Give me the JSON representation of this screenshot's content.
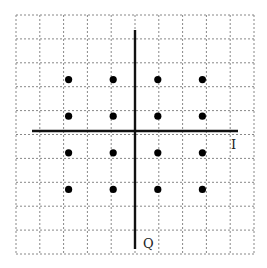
{
  "diagram": {
    "type": "constellation",
    "axes": {
      "horizontal_label": "I",
      "vertical_label": "Q"
    },
    "grid": {
      "divisions": 10,
      "style": "dotted"
    },
    "points": [
      {
        "i": -3,
        "q": 3
      },
      {
        "i": -1,
        "q": 3
      },
      {
        "i": 1,
        "q": 3
      },
      {
        "i": 3,
        "q": 3
      },
      {
        "i": -3,
        "q": 1
      },
      {
        "i": -1,
        "q": 1
      },
      {
        "i": 1,
        "q": 1
      },
      {
        "i": 3,
        "q": 1
      },
      {
        "i": -3,
        "q": -1
      },
      {
        "i": -1,
        "q": -1
      },
      {
        "i": 1,
        "q": -1
      },
      {
        "i": 3,
        "q": -1
      },
      {
        "i": -3,
        "q": -3
      },
      {
        "i": -1,
        "q": -3
      },
      {
        "i": 1,
        "q": -3
      },
      {
        "i": 3,
        "q": -3
      }
    ],
    "colors": {
      "axis": "#111111",
      "grid": "#888888",
      "point": "#000000"
    }
  }
}
